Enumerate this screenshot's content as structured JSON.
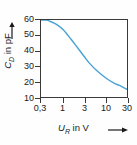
{
  "chart_data": {
    "type": "line",
    "title": "",
    "xlabel": "U_R in V",
    "ylabel": "C_D in pF",
    "xscale": "log",
    "yscale": "linear",
    "xlim": [
      0.3,
      30
    ],
    "ylim": [
      10,
      60
    ],
    "grid": false,
    "legend": null,
    "series": [
      {
        "name": "C_D(U_R)",
        "color": "#4ba3d3",
        "x": [
          0.3,
          0.4,
          0.5,
          0.7,
          1.0,
          1.5,
          2.0,
          3.0,
          4.0,
          6.0,
          10.0,
          15.0,
          20.0,
          30.0
        ],
        "y": [
          60.0,
          60.0,
          59.0,
          57.0,
          53.5,
          47.5,
          43.0,
          36.5,
          32.0,
          27.0,
          22.0,
          19.0,
          17.5,
          15.0
        ]
      }
    ],
    "xticks": [
      {
        "value": 0.3,
        "label": "0,3"
      },
      {
        "value": 1,
        "label": "1"
      },
      {
        "value": 3,
        "label": "3"
      },
      {
        "value": 10,
        "label": "10"
      },
      {
        "value": 30,
        "label": "30"
      }
    ],
    "yticks": [
      {
        "value": 60,
        "label": "60"
      },
      {
        "value": 50,
        "label": "50"
      },
      {
        "value": 40,
        "label": "40"
      },
      {
        "value": 30,
        "label": "30"
      },
      {
        "value": 20,
        "label": "20"
      },
      {
        "value": 10,
        "label": "10"
      }
    ]
  },
  "axes": {
    "y_title_symbol": "C",
    "y_title_sub": "D",
    "y_title_rest": " in pF",
    "x_title_symbol": "U",
    "x_title_sub": "R",
    "x_title_rest": " in V",
    "frame_color": "#3a3a3a",
    "curve_color": "#4ba3d3",
    "background": "#ffffff"
  },
  "icons": {
    "y_arrow": "arrow-up-icon",
    "x_arrow": "arrow-right-icon"
  }
}
